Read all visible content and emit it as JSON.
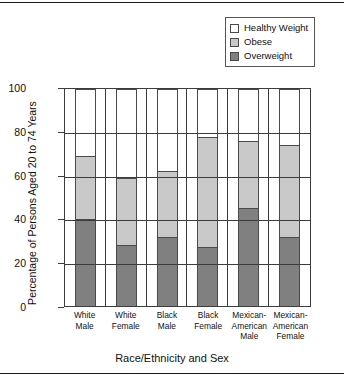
{
  "chart_data": {
    "type": "bar",
    "subtype": "stacked-bar-vertical",
    "title": "",
    "xlabel": "Race/Ethnicity and Sex",
    "ylabel": "Percentage of Persons Aged 20 to 74 Years",
    "ylim": [
      0,
      100
    ],
    "yticks": [
      0,
      20,
      40,
      60,
      80,
      100
    ],
    "grid": true,
    "legend_position": "top-right",
    "categories": [
      "White Male",
      "White Female",
      "Black Male",
      "Black Female",
      "Mexican-American Male",
      "Mexican-American Female"
    ],
    "category_lines": [
      [
        "White",
        "Male"
      ],
      [
        "White",
        "Female"
      ],
      [
        "Black",
        "Male"
      ],
      [
        "Black",
        "Female"
      ],
      [
        "Mexican-",
        "American",
        "Male"
      ],
      [
        "Mexican-",
        "American",
        "Female"
      ]
    ],
    "series": [
      {
        "name": "Overweight",
        "color": "#808080",
        "values": [
          40,
          28,
          32,
          27,
          45,
          32
        ]
      },
      {
        "name": "Obese",
        "color": "#c9c9c9",
        "values": [
          29,
          31,
          30,
          51,
          31,
          42
        ]
      },
      {
        "name": "Healthy Weight",
        "color": "#ffffff",
        "values": [
          31,
          41,
          38,
          22,
          24,
          26
        ]
      }
    ],
    "stack_totals": [
      69,
      59,
      62,
      78,
      76,
      74
    ]
  },
  "legend": {
    "entries": [
      {
        "label": "Healthy Weight",
        "color": "#ffffff"
      },
      {
        "label": "Obese",
        "color": "#c9c9c9"
      },
      {
        "label": "Overweight",
        "color": "#808080"
      }
    ]
  },
  "axes": {
    "y_title": "Percentage of Persons Aged 20 to 74 Years",
    "x_title": "Race/Ethnicity and Sex",
    "y_tick_labels": [
      "100",
      "80",
      "60",
      "40",
      "20",
      "0"
    ]
  }
}
